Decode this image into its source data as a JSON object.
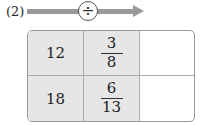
{
  "problem_label": "(2)",
  "operation": {
    "symbol": "÷",
    "icon": "divide-icon"
  },
  "colors": {
    "arrow": "#999999",
    "shaded_cell": "#e6e6e6",
    "border": "#999999"
  },
  "table": {
    "rows": [
      {
        "a": "12",
        "b": {
          "numerator": "3",
          "denominator": "8"
        },
        "answer": ""
      },
      {
        "a": "18",
        "b": {
          "numerator": "6",
          "denominator": "13"
        },
        "answer": ""
      }
    ]
  }
}
